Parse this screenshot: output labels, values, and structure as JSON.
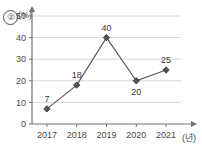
{
  "problem": {
    "number": "②"
  },
  "chart_data": {
    "type": "line",
    "title": "",
    "xlabel": "(년)",
    "ylabel": "(%)",
    "categories": [
      "2017",
      "2018",
      "2019",
      "2020",
      "2021"
    ],
    "values": [
      7,
      18,
      40,
      20,
      25
    ],
    "point_labels": [
      "7",
      "18",
      "40",
      "20",
      "25"
    ],
    "label_positions": [
      "above",
      "above",
      "above",
      "below",
      "above"
    ],
    "yticks": [
      "0",
      "10",
      "20",
      "30",
      "40",
      "50"
    ],
    "ylim": [
      0,
      50
    ],
    "grid": true,
    "legend": "none",
    "marker": "diamond",
    "colors": {
      "line": "#5a5a66",
      "marker": "#55555f",
      "grid": "#d8d8d8",
      "axis": "#707070",
      "text": "#4a4a4a"
    }
  }
}
